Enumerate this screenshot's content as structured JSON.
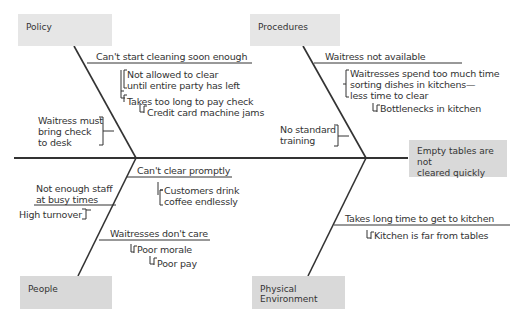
{
  "diagram": {
    "type": "fishbone",
    "effect": "Empty tables are not cleared quickly",
    "categories": {
      "policy": {
        "label": "Policy",
        "causes": [
          {
            "text": "Can't start cleaning soon enough",
            "sub": [
              "Not allowed to clear until entire party has left",
              "Takes too long to pay check"
            ],
            "subsub": [
              "Credit card machine jams"
            ]
          },
          {
            "text": "Waitress must bring check to desk"
          }
        ]
      },
      "procedures": {
        "label": "Procedures",
        "causes": [
          {
            "text": "Waitress not available",
            "sub": [
              "Waitresses spend too much time sorting dishes in kitchens— less time to clear"
            ],
            "subsub": [
              "Bottlenecks in kitchen"
            ]
          },
          {
            "text": "No standard training"
          }
        ]
      },
      "people": {
        "label": "People",
        "causes": [
          {
            "text": "Can't clear promptly",
            "sub": [
              "Customers drink coffee endlessly"
            ]
          },
          {
            "text": "Not enough staff at busy times",
            "sub": [
              "High turnover"
            ]
          },
          {
            "text": "Waitresses don't care",
            "sub": [
              "Poor morale"
            ],
            "subsub": [
              "Poor pay"
            ]
          }
        ]
      },
      "physical": {
        "label": "Physical Environment",
        "causes": [
          {
            "text": "Takes long time to get to kitchen",
            "sub": [
              "Kitchen is far from tables"
            ]
          }
        ]
      }
    },
    "lines": {
      "policy_1": "Can't start cleaning soon enough",
      "policy_1a_l1": "Not allowed to clear",
      "policy_1a_l2": "until entire party has left",
      "policy_1b": "Takes too long to pay check",
      "policy_1b_i": "Credit card machine jams",
      "policy_2_l1": "Waitress must",
      "policy_2_l2": "bring check",
      "policy_2_l3": "to desk",
      "proc_1": "Waitress not available",
      "proc_1a_l1": "Waitresses spend too much time",
      "proc_1a_l2": "sorting dishes in kitchens—",
      "proc_1a_l3": "less time to clear",
      "proc_1a_i": "Bottlenecks in kitchen",
      "proc_2_l1": "No standard",
      "proc_2_l2": "training",
      "people_1": "Can't clear promptly",
      "people_1a_l1": "Customers drink",
      "people_1a_l2": "coffee endlessly",
      "people_2_l1": "Not enough staff",
      "people_2_l2": "at busy times",
      "people_2a": "High turnover",
      "people_3": "Waitresses don't care",
      "people_3a": "Poor morale",
      "people_3a_i": "Poor pay",
      "phys_1": "Takes long time to get to kitchen",
      "phys_1a": "Kitchen is far from tables",
      "effect_l1": "Empty tables are not",
      "effect_l2": "cleared quickly"
    }
  }
}
